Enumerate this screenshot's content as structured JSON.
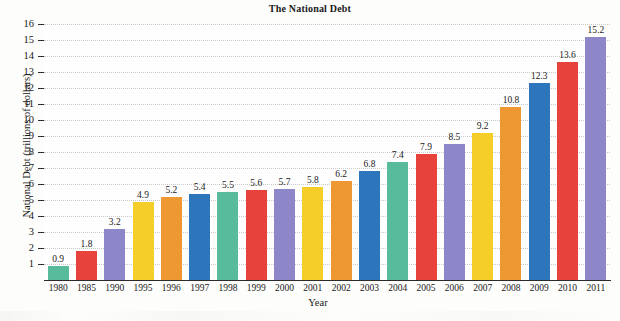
{
  "chart_data": {
    "type": "bar",
    "title": "The National Debt",
    "xlabel": "Year",
    "ylabel": "National Debt (trillions of dollars)",
    "categories": [
      "1980",
      "1985",
      "1990",
      "1995",
      "1996",
      "1997",
      "1998",
      "1999",
      "2000",
      "2001",
      "2002",
      "2003",
      "2004",
      "2005",
      "2006",
      "2007",
      "2008",
      "2009",
      "2010",
      "2011"
    ],
    "values": [
      0.9,
      1.8,
      3.2,
      4.9,
      5.2,
      5.4,
      5.5,
      5.6,
      5.7,
      5.8,
      6.2,
      6.8,
      7.4,
      7.9,
      8.5,
      9.2,
      10.8,
      12.3,
      13.6,
      15.2
    ],
    "value_labels": [
      "0.9",
      "1.8",
      "3.2",
      "4.9",
      "5.2",
      "5.4",
      "5.5",
      "5.6",
      "5.7",
      "5.8",
      "6.2",
      "6.8",
      "7.4",
      "7.9",
      "8.5",
      "9.2",
      "10.8",
      "12.3",
      "13.6",
      "15.2"
    ],
    "bar_colors": [
      "#57bb9c",
      "#e8423d",
      "#8d86c9",
      "#f6ce29",
      "#ee9834",
      "#2d76bc",
      "#57bb9c",
      "#e8423d",
      "#8d86c9",
      "#f6ce29",
      "#ee9834",
      "#2d76bc",
      "#57bb9c",
      "#e8423d",
      "#8d86c9",
      "#f6ce29",
      "#ee9834",
      "#2d76bc",
      "#e8423d",
      "#8d86c9"
    ],
    "ylim": [
      0,
      16
    ],
    "yticks": [
      "1",
      "2",
      "3",
      "4",
      "5",
      "6",
      "7",
      "8",
      "9",
      "10",
      "11",
      "12",
      "13",
      "14",
      "15",
      "16"
    ],
    "grid": true,
    "legend": "none"
  }
}
